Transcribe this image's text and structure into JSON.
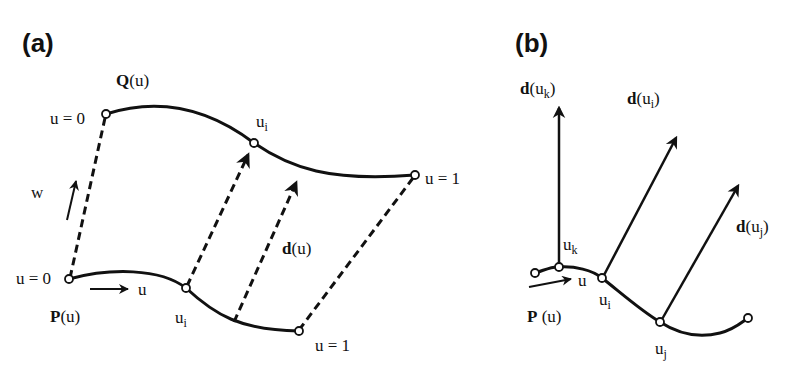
{
  "panels": {
    "a": {
      "label": "(a)",
      "q_curve_label": {
        "bold": "Q",
        "rest": "(u)"
      },
      "p_curve_label": {
        "bold": "P",
        "rest": "(u)"
      },
      "q_start": "u = 0",
      "q_end": "u = 1",
      "p_start": "u = 0",
      "p_end": "u = 1",
      "q_mid": {
        "base": "u",
        "sub": "i"
      },
      "p_mid": {
        "base": "u",
        "sub": "i"
      },
      "direction_label": {
        "bold": "d",
        "rest": "(u)"
      },
      "w_label": "w",
      "u_label": "u"
    },
    "b": {
      "label": "(b)",
      "p_curve_label": {
        "bold": "P",
        "rest": " (u)"
      },
      "u_label": "u",
      "points": [
        {
          "base": "u",
          "sub": "k"
        },
        {
          "base": "u",
          "sub": "i"
        },
        {
          "base": "u",
          "sub": "j"
        }
      ],
      "vectors": [
        {
          "bold": "d",
          "open": "(u",
          "sub": "k",
          "close": ")"
        },
        {
          "bold": "d",
          "open": "(u",
          "sub": "i",
          "close": ")"
        },
        {
          "bold": "d",
          "open": "(u",
          "sub": "j",
          "close": ")"
        }
      ]
    }
  }
}
